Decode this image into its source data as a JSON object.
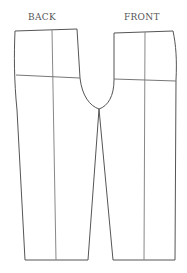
{
  "diagram": {
    "type": "sewing-pattern",
    "labels": {
      "back": "BACK",
      "front": "FRONT"
    },
    "colors": {
      "outline": "#555555",
      "grainline": "#888888",
      "background": "#ffffff"
    },
    "pieces": [
      {
        "name": "back",
        "label": "BACK"
      },
      {
        "name": "front",
        "label": "FRONT"
      }
    ]
  }
}
